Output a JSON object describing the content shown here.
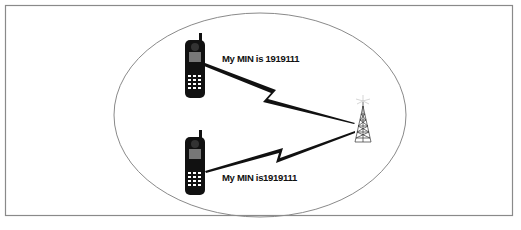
{
  "diagram": {
    "type": "cellular-network-illustration",
    "colors": {
      "frame": "#8a8a8a",
      "ellipse": "#8a8a8a",
      "phone": "#111111",
      "bolt": "#111111",
      "tower": "#333333"
    },
    "cell": {
      "shape": "ellipse",
      "cx": 260,
      "cy": 115,
      "rx": 146,
      "ry": 102
    },
    "phones": [
      {
        "id": "phone-top",
        "label": "My MIN is 1919111"
      },
      {
        "id": "phone-bottom",
        "label": "My MIN is1919111"
      }
    ],
    "tower": {
      "id": "cell-tower"
    }
  }
}
